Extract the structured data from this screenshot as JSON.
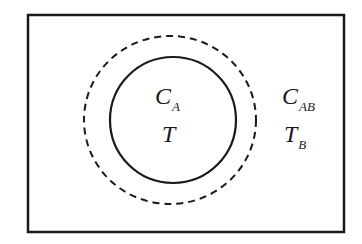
{
  "diagram": {
    "inner_region": {
      "concentration_label": "C",
      "concentration_subscript": "A",
      "temperature_label": "T"
    },
    "outer_region": {
      "concentration_label": "C",
      "concentration_subscript": "AB",
      "temperature_label": "T",
      "temperature_subscript": "B"
    },
    "colors": {
      "stroke": "#1a1a1a",
      "background": "#ffffff"
    }
  }
}
